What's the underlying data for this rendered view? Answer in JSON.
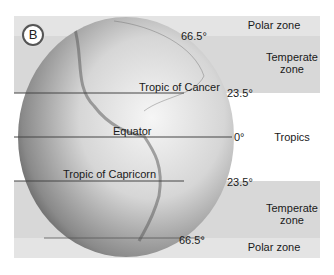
{
  "figure": {
    "badge": "B",
    "colors": {
      "polar_band": "#e3e3e3",
      "temperate_band": "#d9d9d9",
      "tropics_band": "#ffffff",
      "line": "#444444"
    },
    "globe_labels": {
      "cancer": "Tropic of Cancer",
      "equator": "Equator",
      "capricorn": "Tropic of Capricorn"
    },
    "latitudes": {
      "north_polar": "66.5°",
      "north_tropic": "23.5°",
      "equator": "0°",
      "south_tropic": "23.5°",
      "south_polar": "66.5°"
    },
    "zones": {
      "polar_north": "Polar zone",
      "temperate_north_1": "Temperate",
      "temperate_north_2": "zone",
      "tropics": "Tropics",
      "temperate_south_1": "Temperate",
      "temperate_south_2": "zone",
      "polar_south": "Polar zone"
    }
  }
}
